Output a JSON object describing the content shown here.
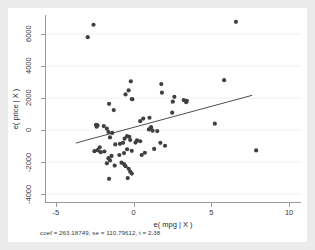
{
  "figure": {
    "background_color": "#ebebeb",
    "plot_background_color": "#ffffff",
    "marker_color": "#404040",
    "line_color": "#3a3a3a",
    "grid_color": "#f0f0f0",
    "axis_color": "#9a9a9a"
  },
  "chart_data": {
    "type": "scatter",
    "title": "",
    "subtitle": "",
    "xlabel": "e( mpg | X )",
    "ylabel": "e( price | X )",
    "note": "coef = 263.18749, se = 110.79612, t = 2.38",
    "xlim": [
      -5.7,
      10.7
    ],
    "ylim": [
      -4500,
      7200
    ],
    "xticks": [
      -5,
      0,
      5,
      10
    ],
    "xticklabels": [
      "-5",
      "0",
      "5",
      "10"
    ],
    "yticks": [
      -4000,
      -2000,
      0,
      2000,
      4000,
      6000
    ],
    "yticklabels": [
      "-4000",
      "-2000",
      "0",
      "2000",
      "4000",
      "6000"
    ],
    "grid": "horizontal",
    "legend": "none",
    "fit_line": {
      "label": "linear fit",
      "slope": 263.18749,
      "se": 110.79612,
      "t": 2.38,
      "x_start": -3.72,
      "y_start": -810,
      "x_end": 7.62,
      "y_end": 2175
    },
    "series": [
      {
        "name": "residuals",
        "n_points": 74,
        "points": [
          [
            -2.95,
            5810
          ],
          [
            -2.58,
            6590
          ],
          [
            6.58,
            6770
          ],
          [
            -0.18,
            3050
          ],
          [
            1.78,
            2880
          ],
          [
            5.82,
            3120
          ],
          [
            -0.32,
            2480
          ],
          [
            1.82,
            2340
          ],
          [
            2.62,
            2080
          ],
          [
            -0.52,
            2230
          ],
          [
            -0.12,
            1940
          ],
          [
            -0.08,
            1930
          ],
          [
            3.22,
            1880
          ],
          [
            3.42,
            1830
          ],
          [
            3.38,
            1740
          ],
          [
            -1.58,
            1640
          ],
          [
            2.52,
            1780
          ],
          [
            -1.28,
            1250
          ],
          [
            2.48,
            1090
          ],
          [
            0.62,
            720
          ],
          [
            0.42,
            560
          ],
          [
            1.02,
            770
          ],
          [
            -2.42,
            320
          ],
          [
            -2.32,
            300
          ],
          [
            -2.38,
            210
          ],
          [
            -1.92,
            250
          ],
          [
            -1.72,
            90
          ],
          [
            5.22,
            400
          ],
          [
            1.12,
            180
          ],
          [
            1.08,
            90
          ],
          [
            0.98,
            40
          ],
          [
            1.22,
            -40
          ],
          [
            1.52,
            -60
          ],
          [
            -1.62,
            -120
          ],
          [
            -1.38,
            -180
          ],
          [
            -1.52,
            -460
          ],
          [
            -0.42,
            -380
          ],
          [
            -0.28,
            -420
          ],
          [
            -0.58,
            -540
          ],
          [
            -0.22,
            -620
          ],
          [
            0.22,
            -640
          ],
          [
            0.42,
            -700
          ],
          [
            0.12,
            -780
          ],
          [
            -0.68,
            -800
          ],
          [
            -0.88,
            -860
          ],
          [
            -1.18,
            -900
          ],
          [
            -2.18,
            -1080
          ],
          [
            -2.32,
            -1260
          ],
          [
            -2.52,
            -1320
          ],
          [
            -2.12,
            -1380
          ],
          [
            -1.88,
            -1340
          ],
          [
            1.72,
            -800
          ],
          [
            2.02,
            -980
          ],
          [
            1.32,
            -1180
          ],
          [
            7.88,
            -1270
          ],
          [
            0.72,
            -1420
          ],
          [
            0.52,
            -1560
          ],
          [
            -0.12,
            -1300
          ],
          [
            -0.42,
            -1200
          ],
          [
            -0.62,
            -1440
          ],
          [
            -0.92,
            -1560
          ],
          [
            -1.42,
            -1620
          ],
          [
            -1.62,
            -1760
          ],
          [
            -1.52,
            -1900
          ],
          [
            -1.72,
            -2080
          ],
          [
            -1.22,
            -2220
          ],
          [
            -0.78,
            -2040
          ],
          [
            -0.52,
            -2260
          ],
          [
            -0.32,
            -2420
          ],
          [
            -0.22,
            -2600
          ],
          [
            -0.12,
            -2720
          ],
          [
            -1.58,
            -3050
          ],
          [
            -0.38,
            -3000
          ],
          [
            -0.62,
            -2130
          ]
        ]
      }
    ]
  },
  "axes": {
    "x_title": "e( mpg | X )",
    "y_title": "e( price | X )"
  },
  "note": {
    "text": "coef = 263.18749, se = 110.79612, t = 2.38"
  }
}
